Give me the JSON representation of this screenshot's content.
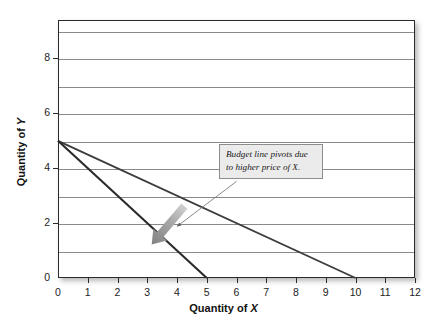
{
  "chart_data": {
    "type": "line",
    "title": "",
    "subtitle": "",
    "xlabel": "Quantity of X",
    "ylabel": "Quantity of Y",
    "xlim": [
      0,
      12
    ],
    "ylim": [
      0,
      9.4
    ],
    "grid": true,
    "grid_axis": "y",
    "legend": "none",
    "x_ticks": [
      0,
      1,
      2,
      3,
      4,
      5,
      6,
      7,
      8,
      9,
      10,
      11,
      12
    ],
    "x_tick_labels": [
      "0",
      "1",
      "2",
      "3",
      "4",
      "5",
      "6",
      "7",
      "8",
      "9",
      "10",
      "11",
      "12"
    ],
    "y_ticks": [
      0,
      2,
      4,
      6,
      8
    ],
    "y_tick_labels": [
      "0",
      "2",
      "4",
      "6",
      "8"
    ],
    "y_gridlines": [
      1,
      2,
      3,
      4,
      5,
      6,
      7,
      8,
      9
    ],
    "series": [
      {
        "name": "Original budget line",
        "points": [
          [
            0,
            5
          ],
          [
            10,
            0
          ]
        ],
        "color": "#3d3d3d",
        "width": 1.9,
        "description": "Shallow budget line from (0,5) to (10,0)"
      },
      {
        "name": "New budget line after price increase",
        "points": [
          [
            0,
            5
          ],
          [
            5,
            0
          ]
        ],
        "color": "#2a2a2a",
        "width": 2.1,
        "description": "Steep budget line from (0,5) to (5,0)"
      }
    ],
    "annotations": [
      {
        "name": "pivot-callout",
        "text_lines": [
          "Budget line pivots due",
          "to higher price of X."
        ],
        "text": "Budget line pivots due to higher price of X.",
        "style": "italic",
        "box_fill": "#ebebeb",
        "box_border": "#8d8d8d",
        "leader_from": [
          6.0,
          3.52
        ],
        "leader_to": [
          4.0,
          1.88
        ]
      },
      {
        "name": "pivot-arrow",
        "shape": "block-arrow",
        "from": [
          4.25,
          2.62
        ],
        "to": [
          3.15,
          1.22
        ],
        "color": "#9e9e9e",
        "description": "Thick gray gradient arrow pointing down-left showing the pivot direction"
      }
    ]
  },
  "axes": {
    "x_title_prefix": "Quantity of ",
    "x_title_var": "X",
    "y_title_prefix": "Quantity of ",
    "y_title_var": "Y"
  },
  "colors": {
    "frame": "#2b2b2b",
    "gridline": "#8a8a8a",
    "line_original": "#3d3d3d",
    "line_new": "#2a2a2a",
    "arrow": "#9e9e9e",
    "callout_fill": "#ebebeb",
    "callout_border": "#8d8d8d",
    "text": "#111111",
    "background": "#ffffff"
  }
}
